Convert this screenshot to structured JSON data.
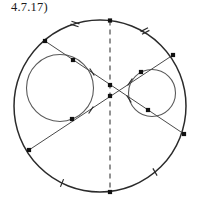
{
  "figure": {
    "label": "4.7.17)",
    "caption_visible": true,
    "background_color": "#ffffff",
    "stroke_color": "#2b2b2b",
    "inner_stroke_color": "#5a5a5a",
    "chord_color": "#4a4a4a",
    "dash_color": "#3a3a3a",
    "marker_color": "#111111",
    "width": 198,
    "height": 207
  },
  "geometry": {
    "outer_circle": {
      "name": "outer-circle",
      "cx": 100,
      "cy": 106,
      "r": 86
    },
    "dashed_axis": {
      "name": "vertical-dashed-diameter",
      "x1": 110,
      "y1": 20.5,
      "x2": 110,
      "y2": 192
    },
    "inscribed_circles": [
      {
        "name": "left-inscribed-circle",
        "cx": 60,
        "cy": 88,
        "r": 33.5
      },
      {
        "name": "right-inscribed-circle",
        "cx": 152,
        "cy": 93,
        "r": 23.5
      }
    ],
    "chords": [
      {
        "name": "chord-upper-left-to-lower-right",
        "x1": 45,
        "y1": 41,
        "x2": 184,
        "y2": 134
      },
      {
        "name": "chord-lower-left-to-upper-right",
        "x1": 29,
        "y1": 150,
        "x2": 173,
        "y2": 55
      }
    ],
    "vertex_dots": [
      {
        "name": "dot-top-of-circle",
        "cx": 110,
        "cy": 20.5
      },
      {
        "name": "dot-bottom-of-circle",
        "cx": 110,
        "cy": 192
      },
      {
        "name": "dot-chord-a-start",
        "cx": 45,
        "cy": 41
      },
      {
        "name": "dot-chord-a-end",
        "cx": 184,
        "cy": 134
      },
      {
        "name": "dot-chord-b-start",
        "cx": 29,
        "cy": 150
      },
      {
        "name": "dot-chord-b-end",
        "cx": 173,
        "cy": 55
      },
      {
        "name": "dot-tangent-left-upper",
        "cx": 73,
        "cy": 60
      },
      {
        "name": "dot-tangent-left-lower",
        "cx": 72,
        "cy": 119
      },
      {
        "name": "dot-tangent-right-upper",
        "cx": 141,
        "cy": 72
      },
      {
        "name": "dot-tangent-right-lower",
        "cx": 148,
        "cy": 110
      },
      {
        "name": "dot-axis-intersection-upper",
        "cx": 110,
        "cy": 85
      },
      {
        "name": "dot-axis-intersection-lower",
        "cx": 110,
        "cy": 96
      }
    ],
    "tick_marks": [
      {
        "name": "tick-arc-upper-left",
        "x": 75,
        "y": 24,
        "angle": 108,
        "count": 2
      },
      {
        "name": "tick-arc-upper-right",
        "x": 145,
        "y": 31,
        "angle": 62,
        "count": 2
      },
      {
        "name": "tick-chord-b-upper-left",
        "x": 92,
        "y": 72,
        "angle": 147,
        "count": 1
      },
      {
        "name": "tick-chord-a-lower-left",
        "x": 91,
        "y": 110,
        "angle": 34,
        "count": 1
      },
      {
        "name": "tick-chord-a-upper-right",
        "x": 130,
        "y": 82,
        "angle": 34,
        "count": 1
      },
      {
        "name": "tick-chord-b-lower-right",
        "x": 129,
        "y": 99,
        "angle": 147,
        "count": 1
      },
      {
        "name": "tick-arc-lower-left",
        "x": 62,
        "y": 183,
        "angle": 22,
        "count": 1
      },
      {
        "name": "tick-arc-lower-right",
        "x": 155,
        "y": 172,
        "angle": 150,
        "count": 1
      }
    ]
  },
  "chart_data": {
    "type": "diagram",
    "title": "4.7.17)",
    "elements": [
      "outer circle",
      "vertical dashed diameter",
      "chord from upper-left to lower-right",
      "chord from lower-left to upper-right",
      "left inscribed circle",
      "right inscribed circle",
      "congruence tick marks on arcs and chord segments"
    ]
  }
}
